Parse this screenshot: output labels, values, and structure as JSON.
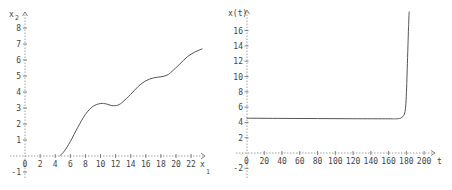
{
  "chart_data": [
    {
      "type": "line",
      "title": "",
      "xlabel": "x1",
      "ylabel": "x2",
      "xlim": [
        -1,
        24
      ],
      "ylim": [
        -1.5,
        8.5
      ],
      "xticks": [
        0,
        2,
        4,
        6,
        8,
        10,
        12,
        14,
        16,
        18,
        20,
        22
      ],
      "yticks": [
        -1,
        1,
        2,
        3,
        4,
        5,
        6,
        7,
        8
      ],
      "grid": false,
      "series": [
        {
          "name": "x2(x1)",
          "x": [
            4.6,
            5.2,
            6.0,
            7.0,
            8.0,
            9.0,
            10.0,
            10.8,
            11.5,
            12.3,
            13.0,
            14.0,
            15.0,
            16.0,
            17.0,
            18.0,
            18.8,
            19.5,
            20.5,
            21.5,
            22.5,
            23.5
          ],
          "y": [
            0.0,
            0.3,
            0.9,
            1.8,
            2.6,
            3.1,
            3.28,
            3.25,
            3.15,
            3.18,
            3.4,
            3.85,
            4.35,
            4.7,
            4.88,
            4.95,
            5.05,
            5.3,
            5.75,
            6.2,
            6.5,
            6.7
          ]
        }
      ]
    },
    {
      "type": "line",
      "title": "",
      "xlabel": "t",
      "ylabel": "x(t)",
      "xlim": [
        -5,
        215
      ],
      "ylim": [
        -3,
        18
      ],
      "xticks": [
        0,
        20,
        40,
        60,
        80,
        100,
        120,
        140,
        160,
        180,
        200
      ],
      "yticks": [
        -2,
        2,
        4,
        6,
        8,
        10,
        12,
        14,
        16
      ],
      "grid": false,
      "series": [
        {
          "name": "x(t)",
          "x": [
            0,
            40,
            80,
            120,
            160,
            168,
            172,
            175,
            177,
            178.5,
            179.5,
            180.3,
            181,
            181.8,
            182.5,
            183.2
          ],
          "y": [
            4.55,
            4.52,
            4.5,
            4.48,
            4.47,
            4.47,
            4.5,
            4.65,
            4.9,
            5.4,
            6.5,
            8.5,
            11,
            14,
            16.5,
            18.5
          ]
        }
      ]
    }
  ],
  "left_plot": {
    "y_axis_label": "x",
    "y_axis_sub": "2",
    "x_axis_label": "x",
    "x_axis_sub": "1",
    "x_tick_labels": [
      "0",
      "2",
      "4",
      "6",
      "8",
      "10",
      "12",
      "14",
      "16",
      "18",
      "20",
      "22"
    ],
    "y_tick_labels": [
      "-1",
      "1",
      "2",
      "3",
      "4",
      "5",
      "6",
      "7",
      "8"
    ]
  },
  "right_plot": {
    "y_axis_label": "x(t)",
    "x_axis_label": "t",
    "x_tick_labels": [
      "0",
      "20",
      "40",
      "60",
      "80",
      "100",
      "120",
      "140",
      "160",
      "180",
      "200"
    ],
    "y_tick_labels": [
      "-2",
      "2",
      "4",
      "6",
      "8",
      "10",
      "12",
      "14",
      "16"
    ]
  }
}
